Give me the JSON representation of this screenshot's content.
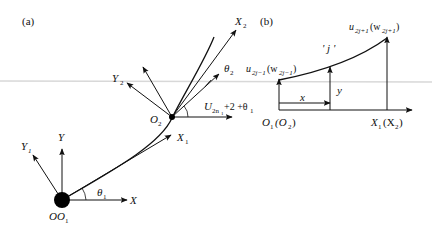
{
  "panels": {
    "a": {
      "label": "(a)",
      "axes": {
        "X": "X",
        "Y": "Y",
        "X1": "X",
        "X1_sub": "1",
        "Y1": "Y",
        "Y1_sub": "1",
        "X2": "X",
        "X2_sub": "2",
        "Y2": "Y",
        "Y2_sub": "2"
      },
      "points": {
        "origin": "O",
        "origin_sub": "",
        "origin2": "O",
        "origin2_sub": "1",
        "O2": "O",
        "O2_sub": "2"
      },
      "angles": {
        "theta1": "θ",
        "theta1_sub": "1",
        "theta2": "θ",
        "theta2_sub": "2",
        "U": "U",
        "U_sub": "2n",
        "U_subsub": "1",
        "U_tail": "+2 +θ",
        "U_tail_sub": "1"
      }
    },
    "b": {
      "label": "(b)",
      "element_label": "' j '",
      "node_left": "u",
      "node_left_sub": "2j−1",
      "node_left_w": "(w",
      "node_left_w_sub": "2j−1",
      "node_left_close": ")",
      "node_right": "u",
      "node_right_sub": "2j+1",
      "node_right_w": "(w",
      "node_right_w_sub": "2j+1",
      "node_right_close": ")",
      "x_label": "x",
      "y_label": "y",
      "origin": "O",
      "origin_sub": "1",
      "origin_paren": "(O",
      "origin_paren_sub": "2",
      "origin_close": ")",
      "end": "X",
      "end_sub": "1",
      "end_paren": "(X",
      "end_paren_sub": "2",
      "end_close": ")"
    }
  },
  "colors": {
    "ink": "#111111",
    "scan_line": "#d0d0d0"
  }
}
